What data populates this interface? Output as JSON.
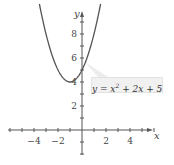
{
  "chart_data": {
    "type": "line",
    "title": "",
    "xlabel": "x",
    "ylabel": "y",
    "xlim": [
      -6.5,
      6.2
    ],
    "ylim": [
      -2.1,
      9.8
    ],
    "x_ticks": [
      -4,
      -2,
      2,
      4
    ],
    "y_ticks": [
      2,
      4,
      6,
      8
    ],
    "grid": false,
    "annotation": "y = x² + 2x + 5",
    "series": [
      {
        "name": "y = x^2 + 2x + 5",
        "function": "x^2 + 2x + 5",
        "x": [
          -3.9,
          -3,
          -2,
          -1,
          0,
          1,
          1.4
        ],
        "y": [
          12.41,
          8,
          5,
          4,
          5,
          8,
          9.76
        ],
        "color": "#555555"
      }
    ]
  },
  "labels": {
    "x_axis": "x",
    "y_axis": "y",
    "x_tick_labels": [
      "−4",
      "−2",
      "2",
      "4"
    ],
    "y_tick_labels": [
      "2",
      "4",
      "6",
      "8"
    ],
    "equation_prefix": "y = x",
    "equation_exp": "2",
    "equation_suffix": " + 2x + 5"
  }
}
